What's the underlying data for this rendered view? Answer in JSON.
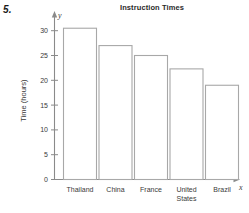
{
  "problem": {
    "number": "5."
  },
  "chart_data": {
    "type": "bar",
    "title": "Instruction Times",
    "xlabel": "",
    "ylabel": "Time (hours)",
    "categories": [
      "Thailand",
      "China",
      "France",
      "United States",
      "Brazil"
    ],
    "values": [
      30.5,
      27,
      25,
      22.3,
      19
    ],
    "ylim": [
      0,
      32
    ],
    "yticks": [
      0,
      5,
      10,
      15,
      20,
      25,
      30
    ],
    "ytick_labels": [
      "0",
      "5",
      "10",
      "15",
      "20",
      "25",
      "30"
    ],
    "grid": false,
    "legend": false,
    "axis_names": {
      "x": "x",
      "y": "y"
    },
    "colors": {
      "bar_fill": "#ffffff",
      "bar_stroke": "#a8a8a8",
      "axis": "#8a8a8a",
      "text": "#3a3a3a",
      "title": "#2a2a2a",
      "background": "#ffffff"
    }
  }
}
